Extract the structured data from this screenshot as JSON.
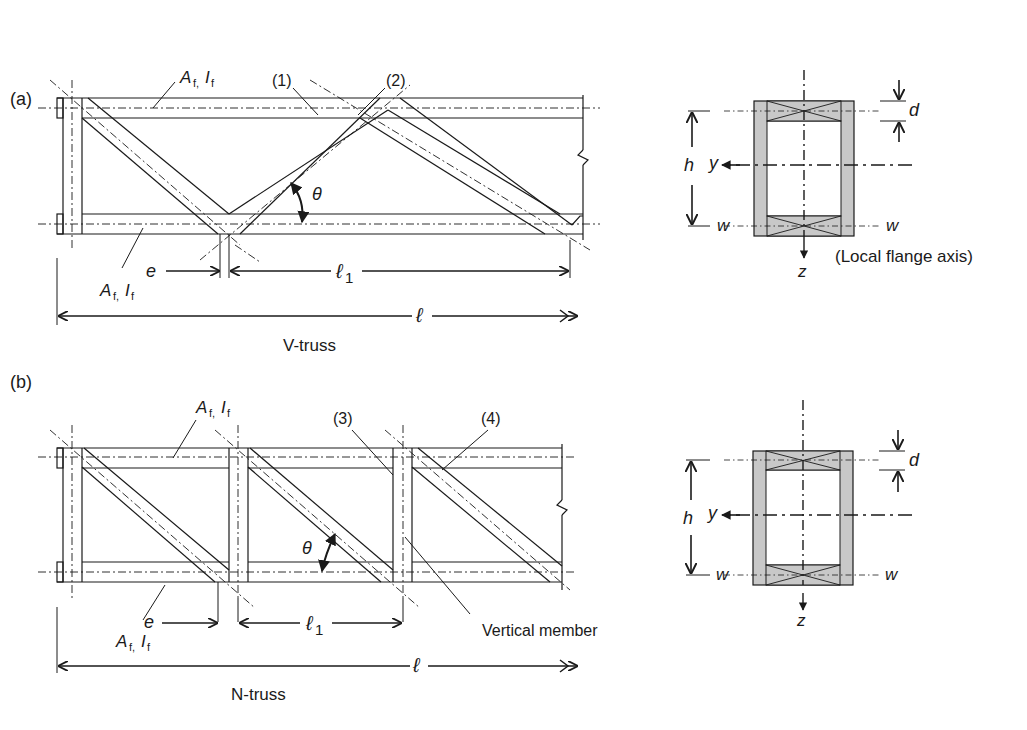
{
  "panels": [
    {
      "id": "a",
      "tag": "(a)",
      "caption": "V-truss",
      "flange_top_label": {
        "A": "A",
        "A_sub": "f,",
        "I": "I",
        "I_sub": "f"
      },
      "flange_bottom_label": {
        "A": "A",
        "A_sub": "f,",
        "I": "I",
        "I_sub": "f"
      },
      "member_labels": [
        "(1)",
        "(2)"
      ],
      "angle_label": "θ",
      "dim_e": "e",
      "dim_l1": "ℓ",
      "dim_l1_sub": "1",
      "dim_l": "ℓ",
      "section": {
        "h": "h",
        "d": "d",
        "y": "y",
        "z": "z",
        "w_left": "w",
        "w_right": "w",
        "note": "(Local flange axis)"
      }
    },
    {
      "id": "b",
      "tag": "(b)",
      "caption": "N-truss",
      "flange_top_label": {
        "A": "A",
        "A_sub": "f,",
        "I": "I",
        "I_sub": "f"
      },
      "flange_bottom_label": {
        "A": "A",
        "A_sub": "f,",
        "I": "I",
        "I_sub": "f"
      },
      "member_labels": [
        "(3)",
        "(4)"
      ],
      "vertical_member_label": "Vertical member",
      "angle_label": "θ",
      "dim_e": "e",
      "dim_l1": "ℓ",
      "dim_l1_sub": "1",
      "dim_l": "ℓ",
      "section": {
        "h": "h",
        "d": "d",
        "y": "y",
        "z": "z",
        "w_left": "w",
        "w_right": "w"
      }
    }
  ],
  "colors": {
    "line": "#1a1a1a",
    "section_fill": "#c8c8c8",
    "background": "#ffffff"
  }
}
